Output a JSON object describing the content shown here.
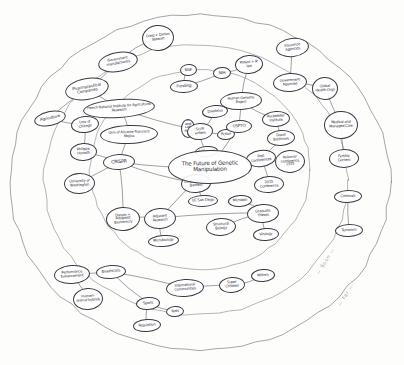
{
  "diagram": {
    "type": "hand-drawn mind map",
    "title": "The Future of Genetic Manipulation",
    "center": {
      "label": "The Future of Genetic Manipulation",
      "x": 210,
      "y": 167,
      "w": 84,
      "h": 34,
      "rot": -1,
      "size": "sz-l"
    },
    "ring_labels": [
      {
        "label": "— Soon —",
        "x": 310,
        "y": 258,
        "rot": -58
      },
      {
        "label": "— Far —",
        "x": 333,
        "y": 292,
        "rot": -58
      }
    ],
    "rings": [
      {
        "name": "outer-boundary-ring",
        "cx": 200,
        "cy": 182,
        "rx": 190,
        "ry": 168
      },
      {
        "name": "middle-ring",
        "cx": 196,
        "cy": 180,
        "rx": 152,
        "ry": 135
      },
      {
        "name": "inner-ring",
        "cx": 200,
        "cy": 170,
        "rx": 110,
        "ry": 100
      }
    ],
    "nodes": [
      {
        "id": "craig-darlan-stewart",
        "label": "Craig + Darlan Stewart",
        "x": 158,
        "y": 38,
        "w": 32,
        "h": 26,
        "rot": -6,
        "size": "sz-xs"
      },
      {
        "id": "government-manufacturers",
        "label": "Government manufacturers",
        "x": 118,
        "y": 62,
        "w": 40,
        "h": 20,
        "rot": -10,
        "size": "sz-xs"
      },
      {
        "id": "pharmaceutical-companies",
        "label": "Pharmaceutical Companies",
        "x": 87,
        "y": 89,
        "w": 44,
        "h": 22,
        "rot": -10,
        "size": "sz-s"
      },
      {
        "id": "agriculture",
        "label": "Agriculture",
        "x": 50,
        "y": 118,
        "w": 32,
        "h": 15,
        "rot": -12,
        "size": "sz-s"
      },
      {
        "id": "univ-of-chicago",
        "label": "Univ of Chicago",
        "x": 85,
        "y": 124,
        "w": 28,
        "h": 17,
        "rot": -6,
        "size": "sz-xs"
      },
      {
        "id": "philippe-horvath",
        "label": "Philippe Horvath",
        "x": 83,
        "y": 152,
        "w": 27,
        "h": 18,
        "rot": -4,
        "size": "sz-xs"
      },
      {
        "id": "university-of-washington",
        "label": "University of Washington",
        "x": 79,
        "y": 183,
        "w": 31,
        "h": 21,
        "rot": -3,
        "size": "sz-xs"
      },
      {
        "id": "crispr",
        "label": "CRISPR",
        "x": 119,
        "y": 162,
        "w": 32,
        "h": 16,
        "rot": -3,
        "size": "sz-m"
      },
      {
        "id": "french-national-institute",
        "label": "French National Institute for Agricultural Research",
        "x": 119,
        "y": 108,
        "w": 72,
        "h": 19,
        "rot": -4,
        "size": "sz-xs"
      },
      {
        "id": "univ-of-alicante",
        "label": "Univ of Alicante Francisco Mojica",
        "x": 129,
        "y": 134,
        "w": 58,
        "h": 19,
        "rot": -2,
        "size": "sz-xs"
      },
      {
        "id": "food-and-lab-meat",
        "label": "Food and Lab Meat",
        "x": 188,
        "y": 128,
        "w": 14,
        "h": 19,
        "rot": 0,
        "size": "sz-xs"
      },
      {
        "id": "nsf",
        "label": "NSF",
        "x": 188,
        "y": 70,
        "w": 17,
        "h": 12,
        "rot": -4,
        "size": "sz-s"
      },
      {
        "id": "funding",
        "label": "Funding",
        "x": 184,
        "y": 86,
        "w": 28,
        "h": 13,
        "rot": -3,
        "size": "sz-s"
      },
      {
        "id": "nih",
        "label": "NIH",
        "x": 222,
        "y": 73,
        "w": 18,
        "h": 12,
        "rot": -3,
        "size": "sz-s"
      },
      {
        "id": "patent-ip-law",
        "label": "Patent + IP law",
        "x": 249,
        "y": 64,
        "w": 28,
        "h": 19,
        "rot": -4,
        "size": "sz-xs"
      },
      {
        "id": "daedalus",
        "label": "Daedalus",
        "x": 215,
        "y": 111,
        "w": 26,
        "h": 13,
        "rot": -5,
        "size": "sz-xs"
      },
      {
        "id": "sci-fi-writers",
        "label": "Sci-Fi writers",
        "x": 200,
        "y": 131,
        "w": 26,
        "h": 17,
        "rot": -4,
        "size": "sz-xs"
      },
      {
        "id": "fiction",
        "label": "Fiction",
        "x": 226,
        "y": 134,
        "w": 18,
        "h": 11,
        "rot": -4,
        "size": "sz-xs"
      },
      {
        "id": "scifi-novel",
        "label": "Scifi novel",
        "x": 206,
        "y": 151,
        "w": 23,
        "h": 11,
        "rot": -4,
        "size": "sz-xs"
      },
      {
        "id": "human-genome-project",
        "label": "Human Genome Project",
        "x": 241,
        "y": 101,
        "w": 42,
        "h": 18,
        "rot": -3,
        "size": "sz-xs"
      },
      {
        "id": "uspto",
        "label": "USPTO",
        "x": 239,
        "y": 126,
        "w": 26,
        "h": 13,
        "rot": -3,
        "size": "sz-s"
      },
      {
        "id": "rockefeller-institute",
        "label": "Rockefeller Institute",
        "x": 276,
        "y": 119,
        "w": 28,
        "h": 16,
        "rot": -4,
        "size": "sz-xs"
      },
      {
        "id": "david-baltimore",
        "label": "David Baltimore",
        "x": 281,
        "y": 138,
        "w": 28,
        "h": 16,
        "rot": -4,
        "size": "sz-xs"
      },
      {
        "id": "past-conferences",
        "label": "Past Conferences",
        "x": 261,
        "y": 158,
        "w": 30,
        "h": 17,
        "rot": -7,
        "size": "sz-xs"
      },
      {
        "id": "asilomar-conference",
        "label": "Asilomar Conference 1975",
        "x": 290,
        "y": 161,
        "w": 30,
        "h": 23,
        "rot": -4,
        "size": "sz-xs"
      },
      {
        "id": "2015-conference",
        "label": "2015 Conference",
        "x": 269,
        "y": 184,
        "w": 30,
        "h": 17,
        "rot": -4,
        "size": "sz-xs"
      },
      {
        "id": "uc-berkeley-jill-banfield",
        "label": "UC Berkeley Jill Banfield",
        "x": 196,
        "y": 183,
        "w": 30,
        "h": 19,
        "rot": -4,
        "size": "sz-xs"
      },
      {
        "id": "uc-san-diego",
        "label": "UC San Diego",
        "x": 203,
        "y": 201,
        "w": 30,
        "h": 12,
        "rot": -2,
        "size": "sz-xs"
      },
      {
        "id": "darwin-adolphist-biomimicry",
        "label": "Darwin + Adolphist Biomimicry",
        "x": 123,
        "y": 219,
        "w": 34,
        "h": 24,
        "rot": -4,
        "size": "sz-xs"
      },
      {
        "id": "adjacent-research",
        "label": "Adjacent Research",
        "x": 160,
        "y": 218,
        "w": 32,
        "h": 21,
        "rot": -4,
        "size": "sz-xs"
      },
      {
        "id": "microbiology",
        "label": "Microbiology",
        "x": 163,
        "y": 241,
        "w": 31,
        "h": 12,
        "rot": -4,
        "size": "sz-xs"
      },
      {
        "id": "microbes",
        "label": "Microbes",
        "x": 240,
        "y": 201,
        "w": 24,
        "h": 12,
        "rot": -4,
        "size": "sz-xs"
      },
      {
        "id": "graduate-theses",
        "label": "Graduate Theses",
        "x": 263,
        "y": 213,
        "w": 32,
        "h": 19,
        "rot": -4,
        "size": "sz-xs"
      },
      {
        "id": "structural-biology",
        "label": "Structural Biology",
        "x": 221,
        "y": 227,
        "w": 30,
        "h": 18,
        "rot": -4,
        "size": "sz-xs"
      },
      {
        "id": "virology",
        "label": "Virology",
        "x": 266,
        "y": 234,
        "w": 26,
        "h": 13,
        "rot": -4,
        "size": "sz-xs"
      },
      {
        "id": "insurance-agencies",
        "label": "Insurance Agencies",
        "x": 292,
        "y": 47,
        "w": 33,
        "h": 19,
        "rot": -7,
        "size": "sz-xs"
      },
      {
        "id": "government-agencies",
        "label": "Government Agencies",
        "x": 290,
        "y": 82,
        "w": 34,
        "h": 19,
        "rot": -4,
        "size": "sz-xs"
      },
      {
        "id": "global-health-orgs",
        "label": "Global Health Orgs",
        "x": 325,
        "y": 88,
        "w": 26,
        "h": 23,
        "rot": -3,
        "size": "sz-xs"
      },
      {
        "id": "medical-and-managed-care",
        "label": "Medical and Managed Care",
        "x": 341,
        "y": 125,
        "w": 34,
        "h": 28,
        "rot": -2,
        "size": "sz-xs"
      },
      {
        "id": "fertility-centers",
        "label": "Fertility Centers",
        "x": 344,
        "y": 158,
        "w": 30,
        "h": 19,
        "rot": -2,
        "size": "sz-xs"
      },
      {
        "id": "criminals",
        "label": "Criminals",
        "x": 348,
        "y": 196,
        "w": 28,
        "h": 13,
        "rot": -2,
        "size": "sz-xs"
      },
      {
        "id": "terrorism",
        "label": "Terrorism",
        "x": 349,
        "y": 230,
        "w": 28,
        "h": 13,
        "rot": -2,
        "size": "sz-xs"
      },
      {
        "id": "performance-enhancement",
        "label": "Performance Enhancement",
        "x": 72,
        "y": 274,
        "w": 36,
        "h": 19,
        "rot": -4,
        "size": "sz-xs"
      },
      {
        "id": "bioethicists",
        "label": "Bioethicists",
        "x": 111,
        "y": 272,
        "w": 30,
        "h": 14,
        "rot": -4,
        "size": "sz-xs"
      },
      {
        "id": "human-animal-hybrids",
        "label": "Human-animal hybrids",
        "x": 88,
        "y": 299,
        "w": 30,
        "h": 22,
        "rot": -4,
        "size": "sz-xs"
      },
      {
        "id": "sports",
        "label": "Sports",
        "x": 148,
        "y": 303,
        "w": 24,
        "h": 13,
        "rot": -4,
        "size": "sz-xs"
      },
      {
        "id": "tests",
        "label": "Tests",
        "x": 175,
        "y": 311,
        "w": 18,
        "h": 11,
        "rot": -4,
        "size": "sz-xs"
      },
      {
        "id": "regulation",
        "label": "Regulation",
        "x": 147,
        "y": 325,
        "w": 28,
        "h": 13,
        "rot": -4,
        "size": "sz-xs"
      },
      {
        "id": "international-communities",
        "label": "International Communities",
        "x": 185,
        "y": 288,
        "w": 38,
        "h": 18,
        "rot": -4,
        "size": "sz-xs"
      },
      {
        "id": "super-children",
        "label": "Super Children",
        "x": 232,
        "y": 285,
        "w": 26,
        "h": 16,
        "rot": -4,
        "size": "sz-xs"
      },
      {
        "id": "military",
        "label": "Military",
        "x": 263,
        "y": 275,
        "w": 24,
        "h": 13,
        "rot": -4,
        "size": "sz-xs"
      }
    ],
    "edges": [
      [
        "craig-darlan-stewart",
        "government-manufacturers"
      ],
      [
        "government-manufacturers",
        "pharmaceutical-companies"
      ],
      [
        "pharmaceutical-companies",
        "agriculture"
      ],
      [
        "pharmaceutical-companies",
        "french-national-institute"
      ],
      [
        "agriculture",
        "univ-of-chicago"
      ],
      [
        "univ-of-chicago",
        "philippe-horvath"
      ],
      [
        "philippe-horvath",
        "crispr"
      ],
      [
        "university-of-washington",
        "crispr"
      ],
      [
        "french-national-institute",
        "univ-of-alicante"
      ],
      [
        "univ-of-alicante",
        "crispr"
      ],
      [
        "french-national-institute",
        "food-and-lab-meat"
      ],
      [
        "nsf",
        "funding"
      ],
      [
        "nih",
        "funding"
      ],
      [
        "nih",
        "patent-ip-law"
      ],
      [
        "patent-ip-law",
        "human-genome-project"
      ],
      [
        "human-genome-project",
        "uspto"
      ],
      [
        "daedalus",
        "sci-fi-writers"
      ],
      [
        "sci-fi-writers",
        "fiction"
      ],
      [
        "sci-fi-writers",
        "scifi-novel"
      ],
      [
        "human-genome-project",
        "rockefeller-institute"
      ],
      [
        "rockefeller-institute",
        "david-baltimore"
      ],
      [
        "david-baltimore",
        "past-conferences"
      ],
      [
        "past-conferences",
        "asilomar-conference"
      ],
      [
        "past-conferences",
        "2015-conference"
      ],
      [
        "crispr",
        "uc-berkeley-jill-banfield"
      ],
      [
        "uc-berkeley-jill-banfield",
        "uc-san-diego"
      ],
      [
        "crispr",
        "darwin-adolphist-biomimicry"
      ],
      [
        "darwin-adolphist-biomimicry",
        "adjacent-research"
      ],
      [
        "adjacent-research",
        "microbiology"
      ],
      [
        "microbes",
        "graduate-theses"
      ],
      [
        "graduate-theses",
        "structural-biology"
      ],
      [
        "graduate-theses",
        "virology"
      ],
      [
        "adjacent-research",
        "graduate-theses"
      ],
      [
        "insurance-agencies",
        "government-agencies"
      ],
      [
        "government-agencies",
        "global-health-orgs"
      ],
      [
        "global-health-orgs",
        "medical-and-managed-care"
      ],
      [
        "medical-and-managed-care",
        "fertility-centers"
      ],
      [
        "criminals",
        "terrorism"
      ],
      [
        "performance-enhancement",
        "bioethicists"
      ],
      [
        "performance-enhancement",
        "human-animal-hybrids"
      ],
      [
        "bioethicists",
        "sports"
      ],
      [
        "sports",
        "tests"
      ],
      [
        "sports",
        "regulation"
      ],
      [
        "bioethicists",
        "international-communities"
      ],
      [
        "international-communities",
        "super-children"
      ],
      [
        "super-children",
        "military"
      ],
      [
        "crispr",
        "the-future-center"
      ],
      [
        "uspto",
        "the-future-center"
      ],
      [
        "the-future-center",
        "uc-berkeley-jill-banfield"
      ],
      [
        "the-future-center",
        "adjacent-research"
      ],
      [
        "the-future-center",
        "scifi-novel"
      ]
    ]
  }
}
